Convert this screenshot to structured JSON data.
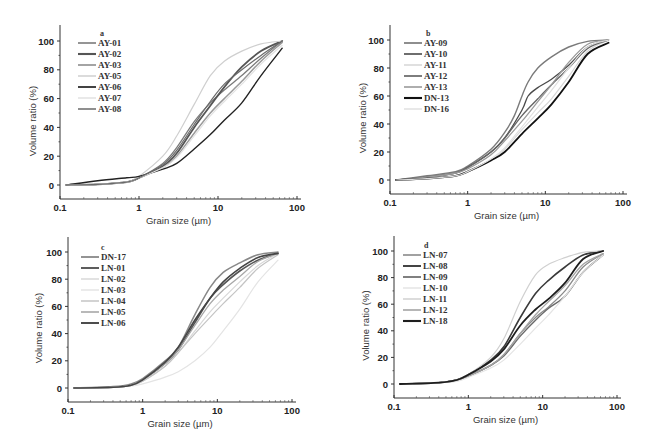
{
  "figure": {
    "panels": [
      {
        "id": "a",
        "letter": "a",
        "xlabel": "Grain size (µm)",
        "ylabel": "Volume ratio (%)"
      },
      {
        "id": "b",
        "letter": "b",
        "xlabel": "Grain size (µm)",
        "ylabel": "Volume ratio (%)"
      },
      {
        "id": "c",
        "letter": "c",
        "xlabel": "Grain size (µm)",
        "ylabel": "Volume ratio (%)"
      },
      {
        "id": "d",
        "letter": "d",
        "xlabel": "Grain size (µm)",
        "ylabel": "Volume ratio (%)"
      }
    ]
  },
  "chart_data": [
    {
      "panel": "a",
      "type": "line",
      "title": "a",
      "xlabel": "Grain size (µm)",
      "ylabel": "Volume ratio (%)",
      "xscale": "log",
      "xlim": [
        0.1,
        100
      ],
      "ylim": [
        -10,
        110
      ],
      "xticks": [
        "0.1",
        "1",
        "10",
        "100"
      ],
      "yticks": [
        "0",
        "20",
        "40",
        "60",
        "80",
        "100"
      ],
      "grid": false,
      "legend_position": "upper left",
      "series": [
        {
          "name": "AY-01",
          "color": "#7a7a7a",
          "width": 1.3,
          "x": [
            0.12,
            0.3,
            0.7,
            1,
            2,
            3,
            5,
            8,
            12,
            20,
            35,
            65
          ],
          "y": [
            0,
            0.5,
            2,
            5,
            15,
            26,
            44,
            57,
            66,
            76,
            88,
            100
          ]
        },
        {
          "name": "AY-02",
          "color": "#555555",
          "width": 1.8,
          "x": [
            0.12,
            0.3,
            0.7,
            1,
            2,
            3,
            5,
            8,
            12,
            20,
            35,
            65
          ],
          "y": [
            0,
            0.5,
            2,
            5,
            13,
            22,
            40,
            55,
            68,
            82,
            93,
            100
          ]
        },
        {
          "name": "AY-03",
          "color": "#9a9a9a",
          "width": 1.5,
          "x": [
            0.12,
            0.3,
            0.7,
            1,
            2,
            3,
            5,
            8,
            12,
            20,
            35,
            65
          ],
          "y": [
            0,
            0.5,
            2,
            5,
            12,
            20,
            36,
            50,
            60,
            72,
            86,
            99
          ]
        },
        {
          "name": "AY-05",
          "color": "#cfcfcf",
          "width": 1.2,
          "x": [
            0.12,
            0.3,
            0.7,
            1,
            2,
            3,
            5,
            8,
            12,
            20,
            35,
            65
          ],
          "y": [
            0,
            0.5,
            2,
            6,
            20,
            34,
            56,
            76,
            86,
            93,
            98,
            100
          ]
        },
        {
          "name": "AY-06",
          "color": "#222222",
          "width": 1.4,
          "x": [
            0.12,
            0.3,
            0.7,
            1,
            2,
            3,
            5,
            8,
            12,
            20,
            35,
            65
          ],
          "y": [
            0,
            3,
            5,
            6,
            11,
            15,
            25,
            35,
            45,
            57,
            76,
            95
          ]
        },
        {
          "name": "AY-07",
          "color": "#e2e2e2",
          "width": 1.2,
          "x": [
            0.12,
            0.3,
            0.7,
            1,
            2,
            3,
            5,
            8,
            12,
            20,
            35,
            65
          ],
          "y": [
            0,
            0.5,
            2,
            5,
            12,
            19,
            34,
            48,
            58,
            70,
            84,
            97
          ]
        },
        {
          "name": "AY-08",
          "color": "#6a6a6a",
          "width": 1.2,
          "x": [
            0.12,
            0.3,
            0.7,
            1,
            2,
            3,
            5,
            8,
            12,
            20,
            35,
            65
          ],
          "y": [
            0,
            0.5,
            2,
            5,
            14,
            24,
            42,
            58,
            70,
            80,
            90,
            100
          ]
        }
      ]
    },
    {
      "panel": "b",
      "type": "line",
      "title": "b",
      "xlabel": "Grain size (µm)",
      "ylabel": "Volume ratio (%)",
      "xscale": "log",
      "xlim": [
        0.1,
        100
      ],
      "ylim": [
        -10,
        110
      ],
      "xticks": [
        "0.1",
        "1",
        "10",
        "100"
      ],
      "yticks": [
        "0",
        "20",
        "40",
        "60",
        "80",
        "100"
      ],
      "grid": false,
      "legend_position": "upper left",
      "series": [
        {
          "name": "AY-09",
          "color": "#7a7a7a",
          "width": 1.4,
          "x": [
            0.12,
            0.3,
            0.7,
            1,
            2,
            3,
            4,
            5,
            6,
            8,
            12,
            20,
            35,
            65
          ],
          "y": [
            0,
            3,
            6,
            10,
            22,
            34,
            46,
            60,
            70,
            80,
            88,
            95,
            99,
            100
          ]
        },
        {
          "name": "AY-10",
          "color": "#4a4a4a",
          "width": 1.3,
          "x": [
            0.12,
            0.3,
            0.7,
            1,
            2,
            3,
            5,
            6,
            8,
            12,
            20,
            35,
            65
          ],
          "y": [
            0,
            2,
            5,
            9,
            20,
            30,
            50,
            60,
            66,
            72,
            82,
            95,
            100
          ]
        },
        {
          "name": "AY-11",
          "color": "#d6d6d6",
          "width": 1.2,
          "x": [
            0.12,
            0.3,
            0.7,
            1,
            2,
            3,
            5,
            8,
            12,
            20,
            35,
            65
          ],
          "y": [
            0,
            1,
            3,
            6,
            14,
            22,
            36,
            48,
            58,
            74,
            92,
            100
          ]
        },
        {
          "name": "AY-12",
          "color": "#666666",
          "width": 1.4,
          "x": [
            0.12,
            0.3,
            0.7,
            1,
            2,
            3,
            5,
            8,
            12,
            20,
            35,
            65
          ],
          "y": [
            0,
            2,
            5,
            9,
            20,
            30,
            46,
            58,
            68,
            80,
            94,
            100
          ]
        },
        {
          "name": "AY-13",
          "color": "#9a9a9a",
          "width": 1.3,
          "x": [
            0.12,
            0.3,
            0.7,
            1,
            2,
            3,
            5,
            8,
            12,
            20,
            35,
            65
          ],
          "y": [
            0,
            2,
            5,
            8,
            18,
            28,
            42,
            56,
            68,
            84,
            97,
            100
          ]
        },
        {
          "name": "DN-13",
          "color": "#111111",
          "width": 1.8,
          "x": [
            0.12,
            0.3,
            0.7,
            1,
            2,
            3,
            5,
            8,
            12,
            20,
            35,
            65
          ],
          "y": [
            0,
            1,
            3,
            6,
            14,
            20,
            33,
            44,
            54,
            70,
            90,
            98
          ]
        },
        {
          "name": "DN-16",
          "color": "#e0e0e0",
          "width": 1.2,
          "x": [
            0.12,
            0.3,
            0.7,
            1,
            2,
            3,
            5,
            8,
            12,
            20,
            35,
            65
          ],
          "y": [
            0,
            1,
            3,
            6,
            15,
            23,
            38,
            52,
            64,
            80,
            95,
            100
          ]
        }
      ]
    },
    {
      "panel": "c",
      "type": "line",
      "title": "c",
      "xlabel": "Grain size (µm)",
      "ylabel": "Volume ratio (%)",
      "xscale": "log",
      "xlim": [
        0.1,
        100
      ],
      "ylim": [
        -10,
        110
      ],
      "xticks": [
        "0.1",
        "1",
        "10",
        "100"
      ],
      "yticks": [
        "0",
        "20",
        "40",
        "60",
        "80",
        "100"
      ],
      "grid": false,
      "legend_position": "upper left",
      "series": [
        {
          "name": "DN-17",
          "color": "#888888",
          "width": 1.5,
          "x": [
            0.12,
            0.4,
            0.7,
            1,
            2,
            3,
            5,
            8,
            12,
            20,
            35,
            65
          ],
          "y": [
            0,
            1,
            3,
            7,
            20,
            30,
            54,
            74,
            85,
            92,
            98,
            100
          ]
        },
        {
          "name": "LN-01",
          "color": "#555555",
          "width": 1.6,
          "x": [
            0.12,
            0.4,
            0.7,
            1,
            2,
            3,
            5,
            8,
            12,
            20,
            35,
            65
          ],
          "y": [
            0,
            0.5,
            2,
            6,
            18,
            28,
            48,
            66,
            76,
            86,
            94,
            99
          ]
        },
        {
          "name": "LN-02",
          "color": "#d8d8d8",
          "width": 1.2,
          "x": [
            0.12,
            0.4,
            0.7,
            1,
            2,
            3,
            5,
            8,
            12,
            20,
            35,
            65
          ],
          "y": [
            0,
            0.5,
            2,
            5,
            16,
            26,
            42,
            56,
            66,
            78,
            90,
            99
          ]
        },
        {
          "name": "LN-03",
          "color": "#e4e4e4",
          "width": 1.2,
          "x": [
            0.12,
            0.4,
            0.7,
            1,
            2,
            3,
            5,
            8,
            12,
            20,
            35,
            65
          ],
          "y": [
            0,
            0.5,
            1.5,
            3,
            8,
            12,
            20,
            30,
            42,
            58,
            78,
            94
          ]
        },
        {
          "name": "LN-04",
          "color": "#c4c4c4",
          "width": 1.2,
          "x": [
            0.12,
            0.4,
            0.7,
            1,
            2,
            3,
            5,
            8,
            12,
            20,
            35,
            65
          ],
          "y": [
            0,
            0.5,
            2,
            5,
            16,
            26,
            40,
            52,
            62,
            74,
            88,
            98
          ]
        },
        {
          "name": "LN-05",
          "color": "#a8a8a8",
          "width": 1.3,
          "x": [
            0.12,
            0.4,
            0.7,
            1,
            2,
            3,
            5,
            8,
            12,
            20,
            35,
            65
          ],
          "y": [
            0,
            0.5,
            2,
            6,
            18,
            28,
            46,
            62,
            72,
            82,
            93,
            99
          ]
        },
        {
          "name": "LN-06",
          "color": "#444444",
          "width": 1.6,
          "x": [
            0.12,
            0.4,
            0.7,
            1,
            2,
            3,
            5,
            8,
            12,
            20,
            35,
            65
          ],
          "y": [
            0,
            0.5,
            2,
            6,
            19,
            30,
            50,
            66,
            78,
            88,
            96,
            99
          ]
        }
      ]
    },
    {
      "panel": "d",
      "type": "line",
      "title": "d",
      "xlabel": "Grain size (µm)",
      "ylabel": "Volume ratio (%)",
      "xscale": "log",
      "xlim": [
        0.1,
        100
      ],
      "ylim": [
        -10,
        110
      ],
      "xticks": [
        "0.1",
        "1",
        "10",
        "100"
      ],
      "yticks": [
        "0",
        "20",
        "40",
        "60",
        "80",
        "100"
      ],
      "grid": false,
      "legend_position": "upper left",
      "series": [
        {
          "name": "LN-07",
          "color": "#8a8a8a",
          "width": 1.3,
          "x": [
            0.12,
            0.4,
            0.7,
            1,
            2,
            3,
            5,
            8,
            12,
            20,
            35,
            65
          ],
          "y": [
            0,
            1,
            3,
            6,
            14,
            22,
            38,
            50,
            58,
            70,
            88,
            98
          ]
        },
        {
          "name": "LN-08",
          "color": "#3a3a3a",
          "width": 1.6,
          "x": [
            0.12,
            0.4,
            0.7,
            1,
            2,
            3,
            5,
            8,
            12,
            20,
            35,
            65
          ],
          "y": [
            0,
            1,
            3,
            7,
            18,
            28,
            50,
            68,
            78,
            88,
            97,
            100
          ]
        },
        {
          "name": "LN-09",
          "color": "#6a6a6a",
          "width": 1.4,
          "x": [
            0.12,
            0.4,
            0.7,
            1,
            2,
            3,
            5,
            8,
            12,
            20,
            35,
            65
          ],
          "y": [
            0,
            1,
            3,
            6,
            14,
            21,
            36,
            48,
            57,
            66,
            84,
            97
          ]
        },
        {
          "name": "LN-10",
          "color": "#e4e4e4",
          "width": 1.2,
          "x": [
            0.12,
            0.4,
            0.7,
            1,
            2,
            3,
            5,
            8,
            12,
            20,
            35,
            65
          ],
          "y": [
            0,
            1,
            2,
            5,
            12,
            18,
            30,
            42,
            52,
            66,
            84,
            97
          ]
        },
        {
          "name": "LN-11",
          "color": "#d0d0d0",
          "width": 1.2,
          "x": [
            0.12,
            0.4,
            0.7,
            1,
            2,
            3,
            5,
            8,
            12,
            20,
            35,
            65
          ],
          "y": [
            0,
            1,
            3,
            7,
            20,
            34,
            62,
            82,
            90,
            95,
            99,
            100
          ]
        },
        {
          "name": "LN-12",
          "color": "#a4a4a4",
          "width": 1.3,
          "x": [
            0.12,
            0.4,
            0.7,
            1,
            2,
            3,
            5,
            8,
            12,
            20,
            35,
            65
          ],
          "y": [
            0,
            1,
            3,
            6,
            14,
            22,
            38,
            52,
            62,
            74,
            90,
            98
          ]
        },
        {
          "name": "LN-18",
          "color": "#1e1e1e",
          "width": 1.8,
          "x": [
            0.12,
            0.4,
            0.7,
            1,
            2,
            3,
            5,
            8,
            12,
            20,
            35,
            65
          ],
          "y": [
            0,
            1,
            3,
            7,
            17,
            26,
            44,
            56,
            64,
            76,
            94,
            100
          ]
        }
      ]
    }
  ]
}
